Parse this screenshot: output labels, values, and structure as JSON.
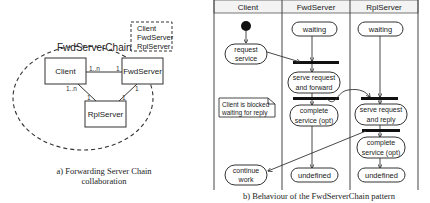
{
  "collaboration": {
    "name": "FwdServerChain",
    "roles_box": [
      "Client",
      "FwdServer",
      "RplServer"
    ],
    "classes": {
      "client": "Client",
      "fwdserver": "FwdServer",
      "rplserver": "RplServer"
    },
    "multiplicities": {
      "client_fwd_client_end": "1..n",
      "client_fwd_fwd_end": "1",
      "client_rpl_client_end": "1..n",
      "client_rpl_rpl_end": "1",
      "fwd_rpl_fwd_end": "1",
      "fwd_rpl_rpl_end": "1"
    },
    "caption_line1": "a) Forwarding Server Chain",
    "caption_line2": "collaboration"
  },
  "activity": {
    "lanes": [
      "Client",
      "FwdServer",
      "RplServer"
    ],
    "client": {
      "request": [
        "request",
        "service"
      ],
      "note": [
        "Client is blocked",
        "waiting for reply"
      ],
      "continue": [
        "continue",
        "work"
      ]
    },
    "fwdserver": {
      "waiting": "waiting",
      "serve": [
        "serve request",
        "and forward"
      ],
      "complete": [
        "complete",
        "service (opt)"
      ],
      "end": "undefined"
    },
    "rplserver": {
      "waiting": "waiting",
      "serve": [
        "serve request",
        "and reply"
      ],
      "complete": [
        "complete",
        "service (opt)"
      ],
      "end": "undefined"
    },
    "caption": "b) Behaviour of the FwdServerChain pattern"
  }
}
